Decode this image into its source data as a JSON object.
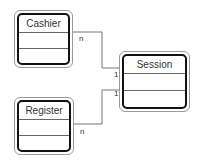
{
  "diagram": {
    "type": "UML class diagram",
    "classes": [
      {
        "id": "cashier",
        "name": "Cashier"
      },
      {
        "id": "session",
        "name": "Session"
      },
      {
        "id": "register",
        "name": "Register"
      }
    ],
    "associations": [
      {
        "from": "cashier",
        "to": "session",
        "from_multiplicity": "n",
        "to_multiplicity": "1"
      },
      {
        "from": "register",
        "to": "session",
        "from_multiplicity": "n",
        "to_multiplicity": "1"
      }
    ]
  }
}
